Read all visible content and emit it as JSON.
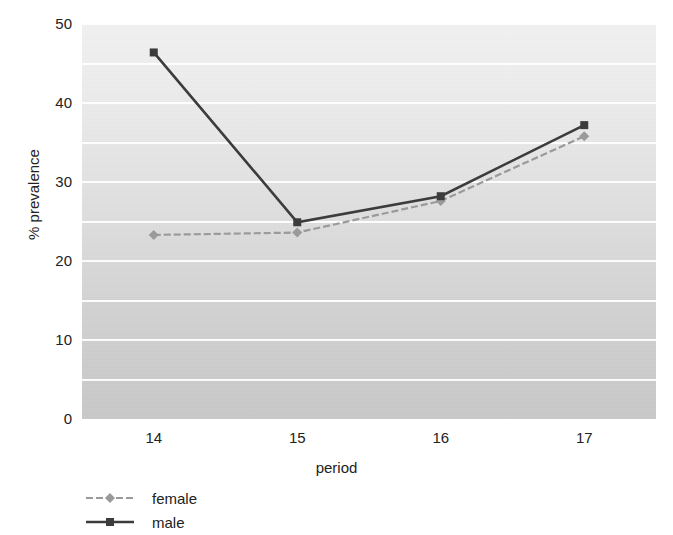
{
  "chart_data": {
    "type": "line",
    "title": "",
    "xlabel": "period",
    "ylabel": "% prevalence",
    "categories": [
      "14",
      "15",
      "16",
      "17"
    ],
    "xlim": [
      13.5,
      17.5
    ],
    "ylim": [
      0,
      50
    ],
    "yticks": [
      0,
      10,
      20,
      30,
      40,
      50
    ],
    "ytick_labels": [
      "0",
      "10",
      "20",
      "30",
      "40",
      "50"
    ],
    "gridlines_y": [
      5,
      10,
      15,
      20,
      25,
      30,
      35,
      40,
      45,
      50
    ],
    "grid": true,
    "legend_position": "bottom-left",
    "series": [
      {
        "name": "female",
        "values": [
          23.3,
          23.6,
          27.6,
          35.8
        ],
        "color": "#9a9a9a",
        "marker": "diamond",
        "linestyle": "dashed"
      },
      {
        "name": "male",
        "values": [
          46.4,
          24.9,
          28.2,
          37.2
        ],
        "color": "#3c3c3c",
        "marker": "square",
        "linestyle": "solid"
      }
    ]
  },
  "legend": {
    "items": [
      {
        "label": "female"
      },
      {
        "label": "male"
      }
    ]
  },
  "colors": {
    "female": "#9a9a9a",
    "male": "#3c3c3c",
    "gridline": "#ffffff",
    "plot_bg_top": "#f2f2f2",
    "plot_bg_bottom": "#c9c9c9",
    "text": "#222222"
  }
}
